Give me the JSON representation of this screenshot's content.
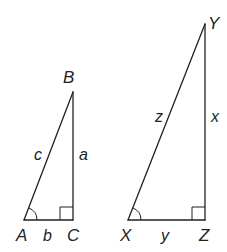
{
  "diagram": {
    "triangles": [
      {
        "id": "ABC",
        "vertices": {
          "A": "A",
          "B": "B",
          "C": "C"
        },
        "sides": {
          "hypotenuse": "c",
          "vertical_leg": "a",
          "base": "b"
        },
        "right_angle_at": "C",
        "marked_angle_at": "A"
      },
      {
        "id": "XYZ",
        "vertices": {
          "X": "X",
          "Y": "Y",
          "Z": "Z"
        },
        "sides": {
          "hypotenuse": "z",
          "vertical_leg": "x",
          "base": "y"
        },
        "right_angle_at": "Z",
        "marked_angle_at": "X"
      }
    ],
    "colors": {
      "stroke": "#231f20",
      "background": "#ffffff"
    }
  }
}
